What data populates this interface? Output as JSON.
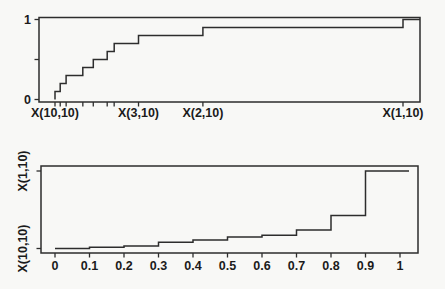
{
  "figure": {
    "background": "#f8f8f6",
    "line_color": "#2d2d2d",
    "text_color": "#1b1b1b"
  },
  "chart_data": [
    {
      "id": "top",
      "type": "line",
      "subtype": "step",
      "description": "Empirical CDF step plot rising from 0 to 1 over the 10 order statistics",
      "series": [
        {
          "name": "ecdf-steps",
          "x_normalized": [
            0,
            0.015,
            0.032,
            0.08,
            0.11,
            0.15,
            0.17,
            0.24,
            0.425,
            1.0
          ],
          "y": [
            0.1,
            0.2,
            0.3,
            0.4,
            0.5,
            0.6,
            0.7,
            0.8,
            0.9,
            1.0
          ]
        }
      ],
      "x_axis": {
        "tick_positions_normalized": [
          0,
          0.015,
          0.032,
          0.08,
          0.11,
          0.15,
          0.17,
          0.24,
          0.425,
          1.0
        ],
        "labels": [
          {
            "text": "X(10,10)",
            "at": 0
          },
          {
            "text": "X(3,10)",
            "at": 0.24
          },
          {
            "text": "X(2,10)",
            "at": 0.425
          },
          {
            "text": "X(1,10)",
            "at": 1.0
          }
        ]
      },
      "y_axis": {
        "range": [
          0,
          1
        ],
        "ticks": [
          {
            "text": "1",
            "value": 1.0
          },
          {
            "text": "",
            "value": 0.5
          },
          {
            "text": "0",
            "value": 0.0
          }
        ]
      },
      "grid": false,
      "legend": false,
      "frame": "box"
    },
    {
      "id": "bottom",
      "type": "line",
      "subtype": "step",
      "description": "Quantile (inverse CDF) step plot of the same 10 order statistics versus probability 0 to 1",
      "series": [
        {
          "name": "quantile-steps",
          "u": [
            0,
            0.1,
            0.2,
            0.3,
            0.4,
            0.5,
            0.6,
            0.7,
            0.8,
            0.9
          ],
          "value_normalized": [
            0,
            0.015,
            0.032,
            0.08,
            0.11,
            0.15,
            0.17,
            0.24,
            0.425,
            1.0
          ]
        }
      ],
      "x_axis": {
        "range": [
          0,
          1
        ],
        "ticks": [
          {
            "text": "0",
            "value": 0.0
          },
          {
            "text": "0.1",
            "value": 0.1
          },
          {
            "text": "0.2",
            "value": 0.2
          },
          {
            "text": "0.3",
            "value": 0.3
          },
          {
            "text": "0.4",
            "value": 0.4
          },
          {
            "text": "0.5",
            "value": 0.5
          },
          {
            "text": "0.6",
            "value": 0.6
          },
          {
            "text": "0.7",
            "value": 0.7
          },
          {
            "text": "0.8",
            "value": 0.8
          },
          {
            "text": "0.9",
            "value": 0.9
          },
          {
            "text": "1",
            "value": 1.0
          }
        ]
      },
      "y_axis": {
        "labels": [
          {
            "text": "X(1,10)",
            "at": 1.0
          },
          {
            "text": "X(10,10)",
            "at": 0.0
          }
        ]
      },
      "grid": false,
      "legend": false,
      "frame": "box"
    }
  ]
}
